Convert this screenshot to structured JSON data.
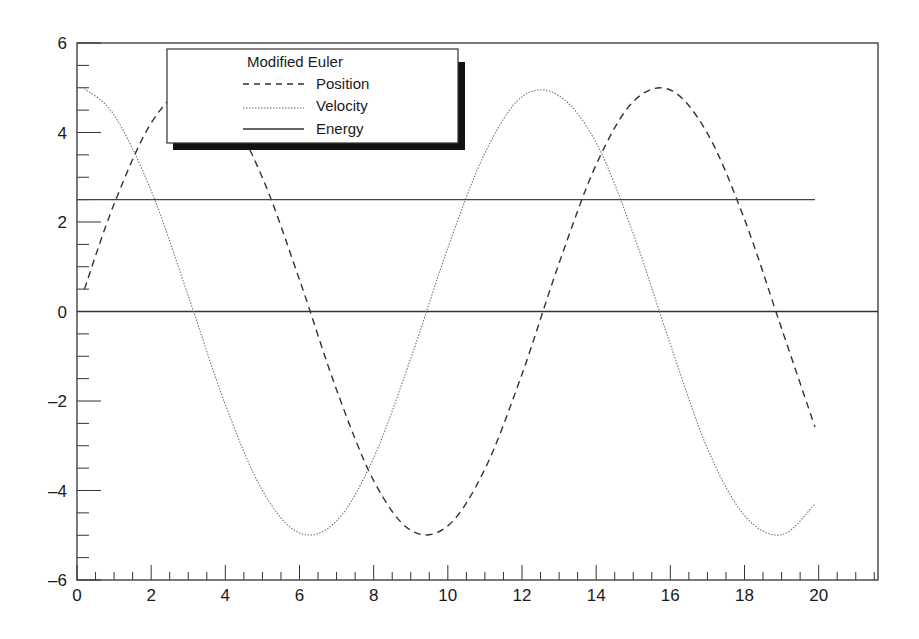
{
  "chart_data": {
    "type": "line",
    "title": "",
    "xlabel": "",
    "ylabel": "",
    "xlim": [
      0,
      21.6
    ],
    "ylim": [
      -6,
      6
    ],
    "grid": false,
    "legend_position": "upper-left (inside, with drop shadow)",
    "legend_title": "Modified Euler",
    "x_ticks": [
      0,
      2,
      4,
      6,
      8,
      10,
      12,
      14,
      16,
      18,
      20
    ],
    "x_tick_labels": [
      "0",
      "2",
      "4",
      "6",
      "8",
      "10",
      "12",
      "14",
      "16",
      "18",
      "20"
    ],
    "y_ticks": [
      -6,
      -4,
      -2,
      0,
      2,
      4,
      6
    ],
    "y_tick_labels": [
      "-6",
      "-4",
      "-2",
      "0",
      "2",
      "4",
      "6"
    ],
    "x_minor_step": 0.5,
    "y_minor_step": 0.5,
    "reference_lines": [
      {
        "y": 0,
        "style": "solid"
      }
    ],
    "x": [
      0.2,
      1,
      2,
      3,
      4,
      5,
      6,
      7,
      8,
      9,
      10,
      11,
      12,
      13,
      14,
      15,
      16,
      17,
      18,
      19,
      19.9
    ],
    "series": [
      {
        "name": "Position",
        "style": "dashed",
        "values": [
          0.5,
          2.4,
          4.21,
          4.99,
          4.55,
          2.99,
          0.71,
          -1.75,
          -3.78,
          -4.89,
          -4.79,
          -3.52,
          -1.4,
          1.08,
          3.28,
          4.69,
          4.95,
          3.98,
          2.06,
          -0.38,
          -2.58
        ]
      },
      {
        "name": "Velocity",
        "style": "dotted",
        "values": [
          4.98,
          4.39,
          2.7,
          0.35,
          -2.08,
          -4.0,
          -4.95,
          -4.68,
          -3.27,
          -1.05,
          1.42,
          3.54,
          4.8,
          4.82,
          3.77,
          1.74,
          -0.73,
          -3.06,
          -4.56,
          -4.99,
          -4.3
        ]
      },
      {
        "name": "Energy",
        "style": "solid",
        "values": [
          2.5,
          2.5,
          2.5,
          2.5,
          2.5,
          2.5,
          2.5,
          2.5,
          2.5,
          2.5,
          2.5,
          2.5,
          2.5,
          2.5,
          2.5,
          2.5,
          2.5,
          2.5,
          2.5,
          2.5,
          2.5
        ]
      }
    ],
    "colors": {
      "axis": "#333333",
      "line": "#333333",
      "background": "#ffffff",
      "legend_shadow": "#111111"
    }
  }
}
